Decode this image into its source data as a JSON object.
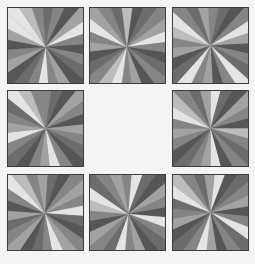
{
  "puzzle": {
    "layout": {
      "rows": 3,
      "cols": 3,
      "empty_cell": [
        1,
        1
      ]
    },
    "palette": {
      "D": "#565656",
      "d": "#6c6c6c",
      "m": "#858585",
      "l": "#a2a2a2",
      "L": "#bcbcbc",
      "W": "#e4e4e4",
      "background": "#f4f4f4",
      "border": "#3c3c3c"
    },
    "tiles": [
      {
        "id": "tile-r0c0",
        "row": 0,
        "col": 0,
        "x": 7,
        "y": 7,
        "cx": 0.5,
        "cy": 0.52,
        "rot": -4,
        "wedges": "dmDlWmDmdDlmWmdDlmDlWWLm"
      },
      {
        "id": "tile-r0c1",
        "row": 0,
        "col": 1,
        "x": 89,
        "y": 7,
        "cx": 0.49,
        "cy": 0.52,
        "rot": 8,
        "wedges": "DdmlWmDdmDlmWLmdDlmWlmdL"
      },
      {
        "id": "tile-r0c2",
        "row": 0,
        "col": 2,
        "x": 172,
        "y": 7,
        "cx": 0.5,
        "cy": 0.5,
        "rot": 12,
        "wedges": "dDmWlDmdWmDlmWdDlmLWmdlm"
      },
      {
        "id": "tile-r1c0",
        "row": 1,
        "col": 0,
        "x": 7,
        "y": 90,
        "cx": 0.5,
        "cy": 0.5,
        "rot": -6,
        "wedges": "mdDlmDlmdDmWlmDdmWlmdWLm"
      },
      {
        "id": "tile-r1c2",
        "row": 1,
        "col": 2,
        "x": 172,
        "y": 90,
        "cx": 0.5,
        "cy": 0.5,
        "rot": 0,
        "wedges": "WdDlmDLmdmDWlmdDmlmWLmdl"
      },
      {
        "id": "tile-r2c0",
        "row": 2,
        "col": 0,
        "x": 7,
        "y": 174,
        "cx": 0.49,
        "cy": 0.51,
        "rot": 4,
        "wedges": "dDmlmWdDmlWmdDlmdlDmWLml"
      },
      {
        "id": "tile-r2c1",
        "row": 2,
        "col": 1,
        "x": 89,
        "y": 174,
        "cx": 0.51,
        "cy": 0.52,
        "rot": -10,
        "wedges": "mWdDlmDWmdDlmWdmlDmLWdml"
      },
      {
        "id": "tile-r2c2",
        "row": 2,
        "col": 2,
        "x": 172,
        "y": 174,
        "cx": 0.5,
        "cy": 0.5,
        "rot": 6,
        "wedges": "WDdmlDmWdmDlWmdDlmdWLmdl"
      }
    ]
  }
}
